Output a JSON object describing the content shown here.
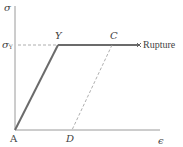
{
  "diagram": {
    "type": "stress-strain curve (elastic-perfectly plastic)",
    "axes": {
      "y_label": "σ",
      "x_label": "ϵ",
      "y_tick_label": "σ",
      "y_tick_subscript": "Y"
    },
    "points": {
      "A": "A",
      "Y": "Y",
      "C": "C",
      "D": "D"
    },
    "annotations": {
      "rupture": "Rupture"
    },
    "colors": {
      "axis": "#9a9a9a",
      "curve": "#6b6b6b",
      "dashed": "#9a9a9a",
      "text": "#444444"
    }
  }
}
